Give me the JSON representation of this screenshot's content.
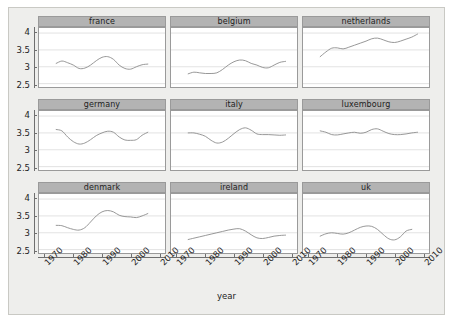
{
  "figure": {
    "background_color": "#eeeeec",
    "panel_background_color": "#ffffff",
    "strip_background_color": "#b3b3b3",
    "line_color": "#8c8c8c",
    "grid_color": "#cfcfcf"
  },
  "axes": {
    "x_title": "year",
    "x_tick_labels": [
      "1970",
      "1980",
      "1990",
      "2000",
      "2010"
    ],
    "y_tick_labels": [
      "2.5",
      "3",
      "3.5",
      "4"
    ]
  },
  "chart_data": {
    "type": "line",
    "title": "",
    "xlabel": "year",
    "ylabel": "",
    "xlim": [
      1968,
      2012
    ],
    "ylim": [
      2.4,
      4.15
    ],
    "x_ticks": [
      1970,
      1980,
      1990,
      2000,
      2010
    ],
    "y_ticks": [
      2.5,
      3,
      3.5,
      4
    ],
    "grid": true,
    "legend": "none",
    "layout": "3x3 small multiples (trellis), shared x and y axes",
    "panel_order": [
      "france",
      "belgium",
      "netherlands",
      "germany",
      "italy",
      "luxembourg",
      "denmark",
      "ireland",
      "uk"
    ],
    "series": [
      {
        "name": "france",
        "row": 0,
        "col": 0,
        "x": [
          1974,
          1976,
          1978,
          1980,
          1982,
          1984,
          1986,
          1988,
          1990,
          1992,
          1994,
          1996,
          1998,
          2000,
          2002,
          2004,
          2006
        ],
        "values": [
          3.1,
          3.17,
          3.12,
          3.05,
          2.95,
          2.96,
          3.05,
          3.18,
          3.28,
          3.3,
          3.22,
          3.05,
          2.95,
          2.93,
          3.0,
          3.06,
          3.08
        ]
      },
      {
        "name": "belgium",
        "row": 0,
        "col": 1,
        "x": [
          1974,
          1976,
          1978,
          1980,
          1982,
          1984,
          1986,
          1988,
          1990,
          1992,
          1994,
          1996,
          1998,
          2000,
          2002,
          2004,
          2006,
          2008
        ],
        "values": [
          2.79,
          2.84,
          2.82,
          2.8,
          2.8,
          2.82,
          2.92,
          3.05,
          3.15,
          3.2,
          3.18,
          3.1,
          3.05,
          2.98,
          2.97,
          3.05,
          3.13,
          3.16
        ]
      },
      {
        "name": "netherlands",
        "row": 0,
        "col": 2,
        "x": [
          1974,
          1976,
          1978,
          1980,
          1982,
          1984,
          1986,
          1988,
          1990,
          1992,
          1994,
          1996,
          1998,
          2000,
          2002,
          2004,
          2006,
          2008
        ],
        "values": [
          3.3,
          3.44,
          3.55,
          3.56,
          3.53,
          3.58,
          3.64,
          3.7,
          3.76,
          3.83,
          3.85,
          3.8,
          3.74,
          3.72,
          3.76,
          3.82,
          3.88,
          3.97
        ]
      },
      {
        "name": "germany",
        "row": 1,
        "col": 0,
        "x": [
          1974,
          1976,
          1978,
          1980,
          1982,
          1984,
          1986,
          1988,
          1990,
          1992,
          1994,
          1996,
          1998,
          2000,
          2002,
          2004,
          2006
        ],
        "values": [
          3.6,
          3.56,
          3.38,
          3.24,
          3.17,
          3.2,
          3.3,
          3.42,
          3.5,
          3.55,
          3.52,
          3.38,
          3.29,
          3.28,
          3.3,
          3.43,
          3.52
        ]
      },
      {
        "name": "italy",
        "row": 1,
        "col": 1,
        "x": [
          1974,
          1976,
          1978,
          1980,
          1982,
          1984,
          1986,
          1988,
          1990,
          1992,
          1994,
          1996,
          1998,
          2000,
          2002,
          2004,
          2006,
          2008
        ],
        "values": [
          3.5,
          3.5,
          3.46,
          3.4,
          3.28,
          3.2,
          3.23,
          3.34,
          3.48,
          3.6,
          3.65,
          3.58,
          3.47,
          3.45,
          3.45,
          3.44,
          3.43,
          3.44
        ]
      },
      {
        "name": "luxembourg",
        "row": 1,
        "col": 2,
        "x": [
          1974,
          1976,
          1978,
          1980,
          1982,
          1984,
          1986,
          1988,
          1990,
          1992,
          1994,
          1996,
          1998,
          2000,
          2002,
          2004,
          2006,
          2008
        ],
        "values": [
          3.56,
          3.52,
          3.45,
          3.44,
          3.47,
          3.5,
          3.52,
          3.49,
          3.52,
          3.6,
          3.62,
          3.55,
          3.48,
          3.45,
          3.45,
          3.47,
          3.5,
          3.52
        ]
      },
      {
        "name": "denmark",
        "row": 2,
        "col": 0,
        "x": [
          1974,
          1976,
          1978,
          1980,
          1982,
          1984,
          1986,
          1988,
          1990,
          1992,
          1994,
          1996,
          1998,
          2000,
          2002,
          2004,
          2006
        ],
        "values": [
          3.22,
          3.21,
          3.15,
          3.1,
          3.08,
          3.15,
          3.32,
          3.5,
          3.62,
          3.66,
          3.62,
          3.52,
          3.48,
          3.47,
          3.45,
          3.5,
          3.57
        ]
      },
      {
        "name": "ireland",
        "row": 2,
        "col": 1,
        "x": [
          1974,
          1976,
          1978,
          1980,
          1982,
          1984,
          1986,
          1988,
          1990,
          1992,
          1994,
          1996,
          1998,
          2000,
          2002,
          2004,
          2006,
          2008
        ],
        "values": [
          2.8,
          2.84,
          2.88,
          2.92,
          2.96,
          3.0,
          3.04,
          3.08,
          3.11,
          3.12,
          3.05,
          2.94,
          2.85,
          2.83,
          2.86,
          2.9,
          2.92,
          2.93
        ]
      },
      {
        "name": "uk",
        "row": 2,
        "col": 2,
        "x": [
          1974,
          1976,
          1978,
          1980,
          1982,
          1984,
          1986,
          1988,
          1990,
          1992,
          1994,
          1996,
          1998,
          2000,
          2002,
          2004,
          2006
        ],
        "values": [
          2.9,
          2.97,
          3.0,
          2.98,
          2.96,
          3.0,
          3.08,
          3.16,
          3.2,
          3.19,
          3.1,
          2.95,
          2.82,
          2.79,
          2.88,
          3.05,
          3.1
        ]
      }
    ]
  }
}
